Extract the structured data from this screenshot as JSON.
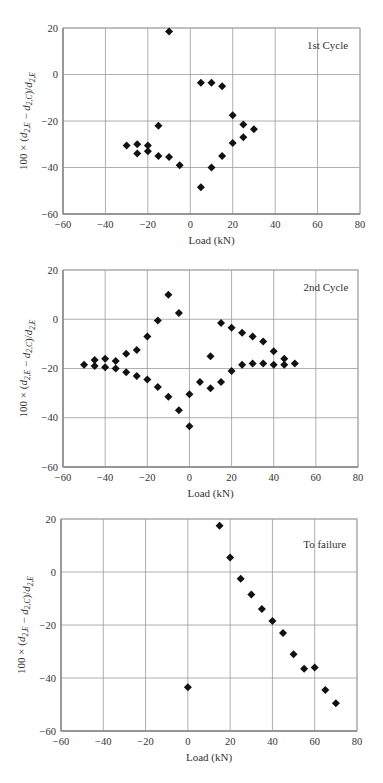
{
  "chart_data": [
    {
      "type": "scatter",
      "title": "",
      "annotation": "1st Cycle",
      "xlabel": "Load (kN)",
      "ylabel": "100 × (d2,E − d2,C)/d2,E",
      "xlim": [
        -60,
        80
      ],
      "ylim": [
        -60,
        20
      ],
      "xticks": [
        -60,
        -40,
        -20,
        0,
        20,
        40,
        60,
        80
      ],
      "yticks": [
        20,
        0,
        -20,
        -40,
        -60
      ],
      "grid": true,
      "marker": "diamond",
      "points": [
        [
          -10,
          18.5
        ],
        [
          5,
          -3.5
        ],
        [
          10,
          -3.5
        ],
        [
          15,
          -5
        ],
        [
          20,
          -17.5
        ],
        [
          25,
          -21.5
        ],
        [
          30,
          -23.5
        ],
        [
          25,
          -27
        ],
        [
          20,
          -29.5
        ],
        [
          15,
          -35
        ],
        [
          10,
          -40
        ],
        [
          5,
          -48.5
        ],
        [
          -5,
          -39
        ],
        [
          -10,
          -35.5
        ],
        [
          -15,
          -35
        ],
        [
          -15,
          -22
        ],
        [
          -20,
          -30.5
        ],
        [
          -20,
          -33
        ],
        [
          -25,
          -30
        ],
        [
          -25,
          -34
        ],
        [
          -30,
          -30.5
        ]
      ]
    },
    {
      "type": "scatter",
      "title": "",
      "annotation": "2nd Cycle",
      "xlabel": "Load (kN)",
      "ylabel": "100 × (d2,E − d2,C)/d2,E",
      "xlim": [
        -60,
        80
      ],
      "ylim": [
        -60,
        20
      ],
      "xticks": [
        -60,
        -40,
        -20,
        0,
        20,
        40,
        60,
        80
      ],
      "yticks": [
        20,
        0,
        -20,
        -40,
        -60
      ],
      "grid": true,
      "marker": "diamond",
      "points": [
        [
          -50,
          -18.5
        ],
        [
          -45,
          -16.5
        ],
        [
          -40,
          -16
        ],
        [
          -35,
          -17
        ],
        [
          -30,
          -14
        ],
        [
          -25,
          -12.5
        ],
        [
          -20,
          -7
        ],
        [
          -15,
          -0.5
        ],
        [
          -10,
          10
        ],
        [
          -5,
          2.5
        ],
        [
          -45,
          -19
        ],
        [
          -40,
          -19.5
        ],
        [
          -35,
          -20
        ],
        [
          -30,
          -21.5
        ],
        [
          -25,
          -23
        ],
        [
          -20,
          -24.5
        ],
        [
          -15,
          -27.5
        ],
        [
          -10,
          -31.5
        ],
        [
          -5,
          -37
        ],
        [
          0,
          -43.5
        ],
        [
          0,
          -30.5
        ],
        [
          5,
          -25.5
        ],
        [
          10,
          -28
        ],
        [
          10,
          -15
        ],
        [
          15,
          -25.5
        ],
        [
          15,
          -1.5
        ],
        [
          20,
          -3.5
        ],
        [
          20,
          -21
        ],
        [
          25,
          -5.5
        ],
        [
          25,
          -18.5
        ],
        [
          30,
          -7
        ],
        [
          30,
          -18
        ],
        [
          35,
          -9
        ],
        [
          35,
          -18
        ],
        [
          40,
          -13
        ],
        [
          40,
          -18.5
        ],
        [
          45,
          -16
        ],
        [
          45,
          -18.5
        ],
        [
          50,
          -18
        ]
      ]
    },
    {
      "type": "scatter",
      "title": "",
      "annotation": "To failure",
      "xlabel": "Load (kN)",
      "ylabel": "100 × (d2,E − d2,C)/d2,E",
      "xlim": [
        -60,
        80
      ],
      "ylim": [
        -60,
        20
      ],
      "xticks": [
        -60,
        -40,
        -20,
        0,
        20,
        40,
        60,
        80
      ],
      "yticks": [
        20,
        0,
        -20,
        -40,
        -60
      ],
      "grid": true,
      "marker": "diamond",
      "points": [
        [
          0,
          -43.5
        ],
        [
          15,
          17.5
        ],
        [
          20,
          5.5
        ],
        [
          25,
          -2.5
        ],
        [
          30,
          -8.5
        ],
        [
          35,
          -14
        ],
        [
          40,
          -18.5
        ],
        [
          45,
          -23
        ],
        [
          50,
          -31
        ],
        [
          55,
          -36.5
        ],
        [
          60,
          -36
        ],
        [
          65,
          -44.5
        ],
        [
          70,
          -49.5
        ]
      ]
    }
  ],
  "layout": {
    "charts": [
      {
        "left": 63,
        "right": 360,
        "top": 28,
        "bottom": 214
      },
      {
        "left": 63,
        "right": 358,
        "top": 270,
        "bottom": 467
      },
      {
        "left": 61,
        "right": 357,
        "top": 519,
        "bottom": 731
      }
    ],
    "colors": {
      "grid": "#9a9a9a",
      "frame": "#a8a8a8",
      "marker": "#111111",
      "text": "#333333"
    }
  }
}
